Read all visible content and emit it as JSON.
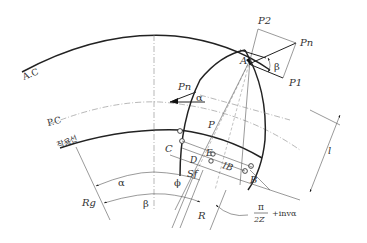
{
  "diagram": {
    "circles": {
      "addendum_circle": "A.C",
      "pitch_circle": "P.C",
      "line_of_action_label": "작용선"
    },
    "forces": {
      "normal_force_top": "Pn",
      "normal_force_left": "Pn",
      "tangential_component": "P2",
      "radial_component": "P1",
      "force_P": "P"
    },
    "angles": {
      "pressure_angle": "α",
      "helix_angle_top": "β",
      "bottom_alpha": "α",
      "bottom_beta": "β",
      "phi": "ϕ"
    },
    "points": {
      "A": "A",
      "B": "B",
      "C": "C",
      "D": "D",
      "E": "E"
    },
    "dimensions": {
      "Sf": "Sf",
      "IB": "IB",
      "R": "R",
      "Rg": "Rg",
      "l": "l"
    },
    "formula": {
      "numerator": "π",
      "denominator": "2Z",
      "suffix": "+invα"
    }
  }
}
